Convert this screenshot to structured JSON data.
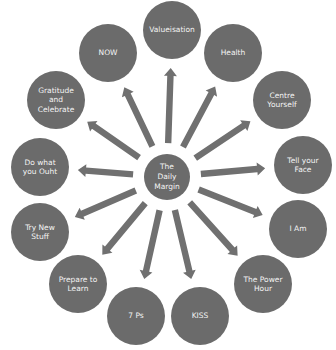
{
  "diagram": {
    "title": "The Daily Margin",
    "center": {
      "label": "The\nDaily\nMargin",
      "x": 167,
      "y": 177
    },
    "colors": {
      "node_fill": "#6b6b6b",
      "arrow_fill": "#707070",
      "text": "#f4f4f4",
      "background": "#ffffff"
    },
    "nodes": [
      {
        "id": "valueisation",
        "label": "Valueisation",
        "x": 172,
        "y": 30
      },
      {
        "id": "health",
        "label": "Health",
        "x": 233,
        "y": 53
      },
      {
        "id": "centre-yourself",
        "label": "Centre\nYourself",
        "x": 282,
        "y": 100
      },
      {
        "id": "tell-your-face",
        "label": "Tell your\nFace",
        "x": 303,
        "y": 165
      },
      {
        "id": "i-am",
        "label": "I Am",
        "x": 298,
        "y": 229
      },
      {
        "id": "the-power-hour",
        "label": "The Power\nHour",
        "x": 263,
        "y": 284
      },
      {
        "id": "kiss",
        "label": "KISS",
        "x": 200,
        "y": 316
      },
      {
        "id": "7-ps",
        "label": "7 Ps",
        "x": 136,
        "y": 316
      },
      {
        "id": "prepare-to-learn",
        "label": "Prepare to\nLearn",
        "x": 78,
        "y": 284
      },
      {
        "id": "try-new-stuff",
        "label": "Try New\nStuff",
        "x": 40,
        "y": 232
      },
      {
        "id": "do-what-you-ouht",
        "label": "Do what\nyou Ouht",
        "x": 40,
        "y": 167
      },
      {
        "id": "gratitude-and-celebrate",
        "label": "Gratitude\nand\nCelebrate",
        "x": 56,
        "y": 100
      },
      {
        "id": "now",
        "label": "NOW",
        "x": 108,
        "y": 53
      }
    ]
  }
}
